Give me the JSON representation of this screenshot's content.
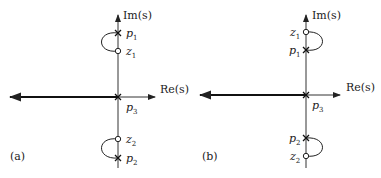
{
  "panels": [
    {
      "label": "(a)",
      "im_axis": "Im(s)",
      "re_axis": "Re(s)",
      "points": {
        "p1": {
          "name": "p",
          "sub": "1",
          "type": "pole"
        },
        "z1": {
          "name": "z",
          "sub": "1",
          "type": "zero"
        },
        "p3": {
          "name": "p",
          "sub": "3",
          "type": "pole"
        },
        "z2": {
          "name": "z",
          "sub": "2",
          "type": "zero"
        },
        "p2": {
          "name": "p",
          "sub": "2",
          "type": "pole"
        }
      }
    },
    {
      "label": "(b)",
      "im_axis": "Im(s)",
      "re_axis": "Re(s)",
      "points": {
        "z1": {
          "name": "z",
          "sub": "1",
          "type": "zero"
        },
        "p1": {
          "name": "p",
          "sub": "1",
          "type": "pole"
        },
        "p3": {
          "name": "p",
          "sub": "3",
          "type": "pole"
        },
        "p2": {
          "name": "p",
          "sub": "2",
          "type": "pole"
        },
        "z2": {
          "name": "z",
          "sub": "2",
          "type": "zero"
        }
      }
    }
  ]
}
